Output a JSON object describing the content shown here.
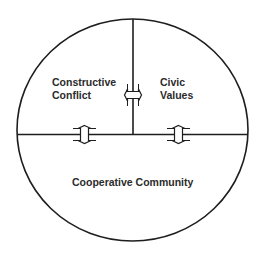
{
  "diagram": {
    "title": "",
    "colors": {
      "stroke": "#1e1e1e",
      "text": "#2b2b2b",
      "background": "#ffffff"
    },
    "regions": [
      {
        "id": "constructive-conflict",
        "lines": [
          "Constructive",
          "Conflict"
        ],
        "position": "upper-left"
      },
      {
        "id": "civic-values",
        "lines": [
          "Civic",
          "Values"
        ],
        "position": "upper-right"
      },
      {
        "id": "cooperative-community",
        "lines": [
          "Cooperative Community"
        ],
        "position": "bottom-half"
      }
    ],
    "connectors": [
      {
        "id": "conflict-values",
        "type": "double-arrow-horizontal",
        "between": [
          "Constructive Conflict",
          "Civic Values"
        ]
      },
      {
        "id": "conflict-community",
        "type": "double-arrow-vertical",
        "between": [
          "Constructive Conflict",
          "Cooperative Community"
        ]
      },
      {
        "id": "values-community",
        "type": "double-arrow-vertical",
        "between": [
          "Civic Values",
          "Cooperative Community"
        ]
      }
    ]
  }
}
